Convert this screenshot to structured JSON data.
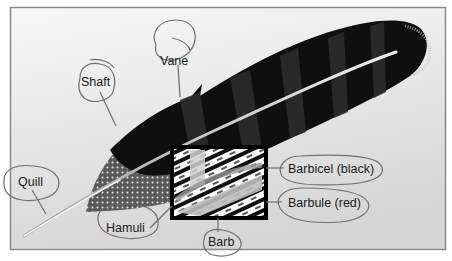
{
  "figure": {
    "labels": {
      "vane": "Vane",
      "shaft": "Shaft",
      "quill": "Quill",
      "hamuli": "Hamuli",
      "barb": "Barb",
      "barbicel": "Barbicel (black)",
      "barbule": "Barbule (red)"
    },
    "colors": {
      "frame_border": "#8a8a8a",
      "background_top": "#f7f7f7",
      "background_bottom": "#d8d8d8",
      "feather_dark": "#0d0d0d",
      "feather_band": "#2b2b2b",
      "shaft": "#c9c9c9",
      "annotation_ink": "#6f6f6f",
      "inset_border": "#000000"
    }
  }
}
